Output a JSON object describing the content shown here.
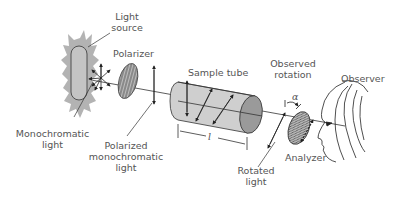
{
  "labels": {
    "light_source": [
      "Light",
      "source"
    ],
    "polarizer": "Polarizer",
    "sample_tube": "Sample tube",
    "observed_rotation": [
      "Observed",
      "rotation"
    ],
    "observer": "Observer",
    "monochromatic_light": [
      "Monochromatic",
      "light"
    ],
    "polarized_monochromatic_light": [
      "Polarized",
      "monochromatic",
      "light"
    ],
    "rotated_light": [
      "Rotated",
      "light"
    ],
    "analyzer": "Analyzer",
    "tube_length_symbol": "l",
    "angle_symbol": "α"
  },
  "colors": {
    "glow": "#b3b3b3",
    "lamp": "#c4c4c4",
    "tube_body": "#cfcfcf",
    "tube_end": "#9a9a9a",
    "stroke": "#333333",
    "text": "#555555"
  }
}
